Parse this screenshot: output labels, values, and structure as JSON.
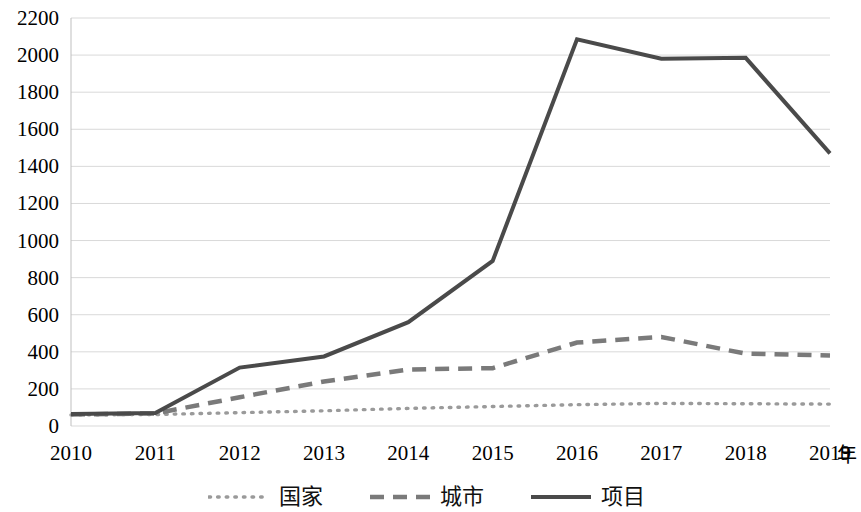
{
  "chart_data": {
    "type": "line",
    "title": "",
    "subtitle": "",
    "xlabel": "年",
    "ylabel": "",
    "x": [
      2010,
      2011,
      2012,
      2013,
      2014,
      2015,
      2016,
      2017,
      2018,
      2019
    ],
    "categories": [
      "2010",
      "2011",
      "2012",
      "2013",
      "2014",
      "2015",
      "2016",
      "2017",
      "2018",
      "2019"
    ],
    "xlim": [
      2010,
      2019
    ],
    "ylim": [
      0,
      2200
    ],
    "ytick_step": 200,
    "yticks": [
      0,
      200,
      400,
      600,
      800,
      1000,
      1200,
      1400,
      1600,
      1800,
      2000,
      2200
    ],
    "ytick_labels": [
      "0",
      "200",
      "400",
      "600",
      "800",
      "1000",
      "1200",
      "1400",
      "1600",
      "1800",
      "2000",
      "2200"
    ],
    "grid": "horizontal",
    "legend_position": "bottom",
    "series": [
      {
        "name": "国家",
        "style": "dotted",
        "color": "#9a9a9a",
        "values": [
          60,
          62,
          72,
          82,
          95,
          105,
          115,
          122,
          120,
          118
        ]
      },
      {
        "name": "城市",
        "style": "dashed",
        "color": "#7a7a7a",
        "values": [
          62,
          68,
          155,
          240,
          305,
          312,
          450,
          480,
          390,
          380
        ]
      },
      {
        "name": "项目",
        "style": "solid",
        "color": "#4a4a4a",
        "values": [
          65,
          70,
          315,
          375,
          560,
          890,
          2085,
          1980,
          1985,
          1470
        ]
      }
    ]
  },
  "axes": {
    "x_unit_label": "年"
  },
  "colors": {
    "gridline": "#d9d9d9",
    "axis": "#bfbfbf",
    "text": "#000000",
    "series_guojia": "#9a9a9a",
    "series_chengshi": "#7a7a7a",
    "series_xiangmu": "#4a4a4a"
  }
}
